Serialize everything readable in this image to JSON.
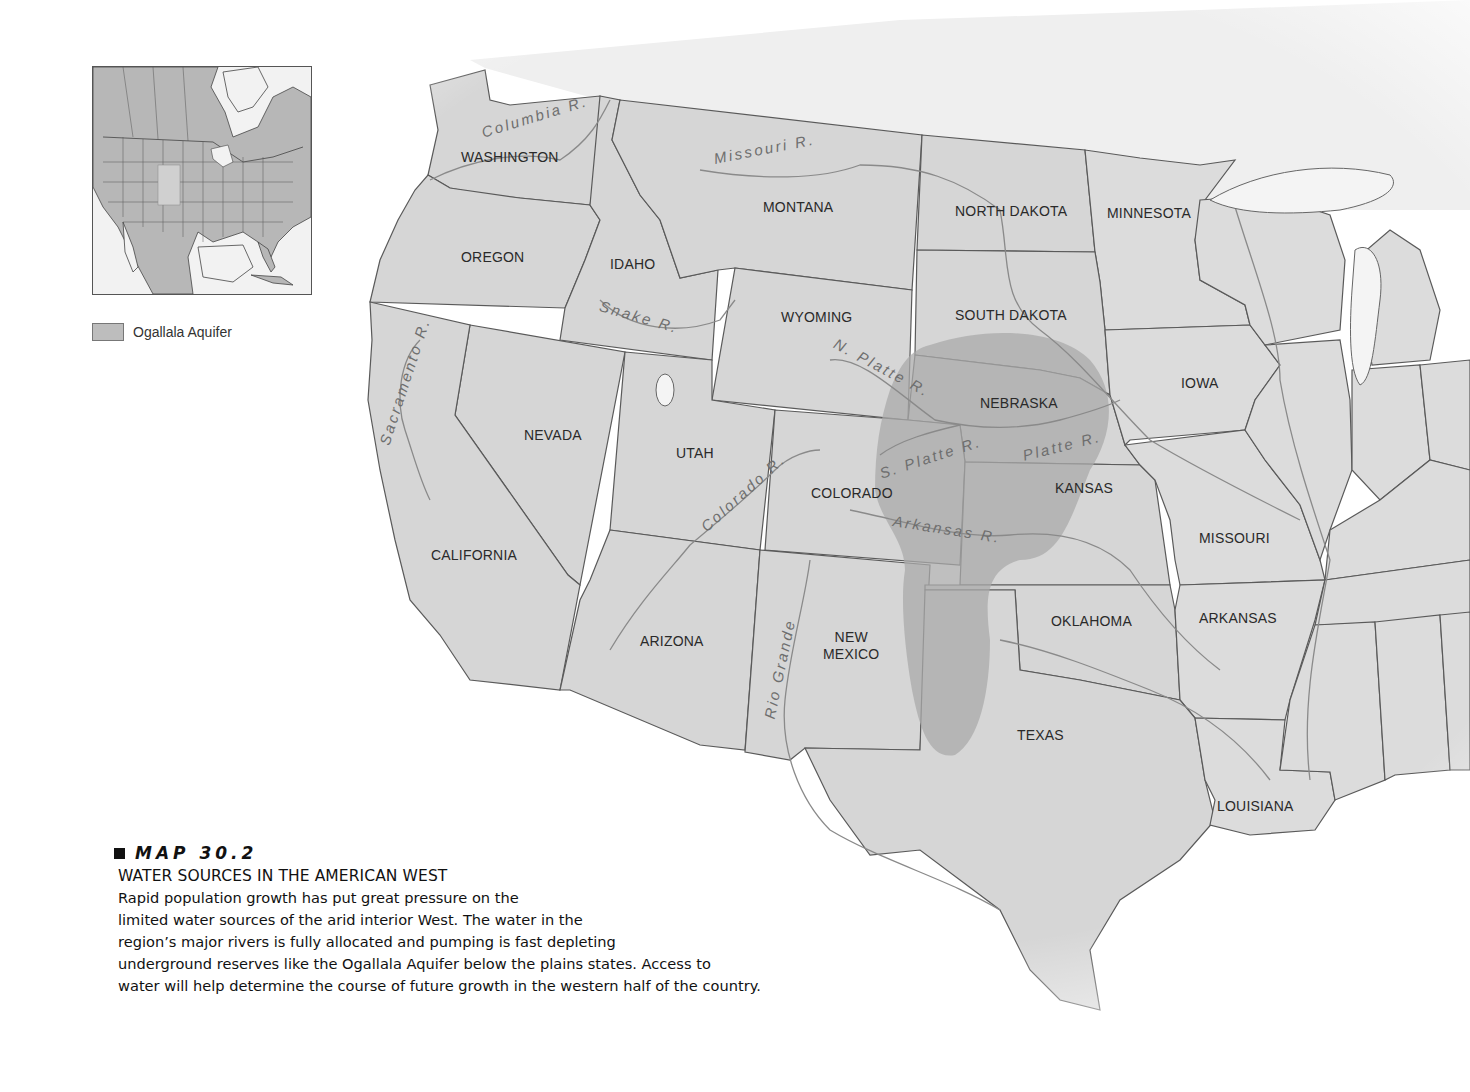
{
  "map": {
    "title": "Water Sources in the American West",
    "colors": {
      "state_fill": "#d6d6d6",
      "aquifer_fill": "#a9a9a9",
      "border": "#5a5a5a",
      "river": "#8a8a8a",
      "background": "#ffffff"
    },
    "states": [
      {
        "id": "washington",
        "label": "WASHINGTON"
      },
      {
        "id": "oregon",
        "label": "OREGON"
      },
      {
        "id": "idaho",
        "label": "IDAHO"
      },
      {
        "id": "montana",
        "label": "MONTANA"
      },
      {
        "id": "north-dakota",
        "label": "NORTH DAKOTA"
      },
      {
        "id": "minnesota",
        "label": "MINNESOTA"
      },
      {
        "id": "wyoming",
        "label": "WYOMING"
      },
      {
        "id": "south-dakota",
        "label": "SOUTH DAKOTA"
      },
      {
        "id": "nevada",
        "label": "NEVADA"
      },
      {
        "id": "utah",
        "label": "UTAH"
      },
      {
        "id": "nebraska",
        "label": "NEBRASKA"
      },
      {
        "id": "iowa",
        "label": "IOWA"
      },
      {
        "id": "colorado",
        "label": "COLORADO"
      },
      {
        "id": "kansas",
        "label": "KANSAS"
      },
      {
        "id": "california",
        "label": "CALIFORNIA"
      },
      {
        "id": "missouri",
        "label": "MISSOURI"
      },
      {
        "id": "arizona",
        "label": "ARIZONA"
      },
      {
        "id": "new-mexico",
        "label": "NEW\nMEXICO"
      },
      {
        "id": "oklahoma",
        "label": "OKLAHOMA"
      },
      {
        "id": "arkansas",
        "label": "ARKANSAS"
      },
      {
        "id": "texas",
        "label": "TEXAS"
      },
      {
        "id": "louisiana",
        "label": "LOUISIANA"
      }
    ],
    "rivers": [
      {
        "id": "columbia",
        "label": "Columbia R."
      },
      {
        "id": "missouri",
        "label": "Missouri R."
      },
      {
        "id": "snake",
        "label": "Snake R."
      },
      {
        "id": "sacramento",
        "label": "Sacramento R."
      },
      {
        "id": "north-platte",
        "label": "N. Platte R."
      },
      {
        "id": "south-platte",
        "label": "S. Platte R."
      },
      {
        "id": "platte",
        "label": "Platte R."
      },
      {
        "id": "colorado",
        "label": "Colorado R."
      },
      {
        "id": "arkansas",
        "label": "Arkansas R."
      },
      {
        "id": "rio-grande",
        "label": "Rio Grande"
      }
    ]
  },
  "inset": {
    "legend_label": "Ogallala Aquifer"
  },
  "caption": {
    "map_number": "MAP 30.2",
    "title": "WATER SOURCES IN THE AMERICAN WEST",
    "lines": [
      "Rapid population growth has put great pressure on the",
      "limited water sources of the arid interior West. The water in the",
      "region’s major rivers is fully allocated and pumping is fast depleting",
      "underground reserves like the Ogallala Aquifer below the plains states. Access to",
      "water will help determine the course of future growth in the western half of the country."
    ]
  }
}
